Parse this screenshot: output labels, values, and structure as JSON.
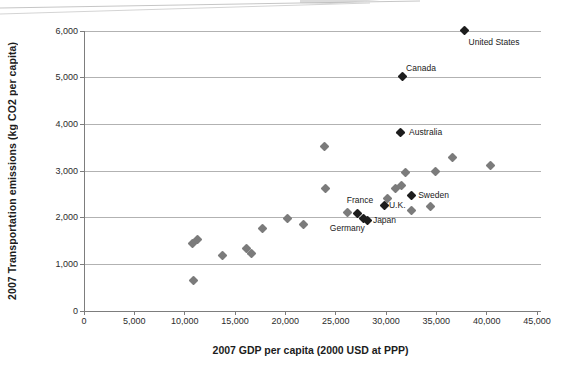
{
  "chart_data": {
    "type": "scatter",
    "title": "",
    "xlabel": "2007 GDP per capita (2000 USD at PPP)",
    "ylabel": "2007 Transportation emissions (kg CO2 per capita)",
    "xlim": [
      0,
      45000
    ],
    "ylim": [
      0,
      6000
    ],
    "x_ticks": [
      0,
      5000,
      10000,
      15000,
      20000,
      25000,
      30000,
      35000,
      40000,
      45000
    ],
    "x_tick_labels": [
      "0",
      "5,000",
      "10,000",
      "15,000",
      "20,000",
      "25,000",
      "30,000",
      "35,000",
      "40,000",
      "45,000"
    ],
    "y_ticks": [
      0,
      1000,
      2000,
      3000,
      4000,
      5000,
      6000
    ],
    "y_tick_labels": [
      "0",
      "1,000",
      "2,000",
      "3,000",
      "4,000",
      "5,000",
      "6,000"
    ],
    "grid": "horizontal",
    "legend": "none",
    "colors": {
      "labeled_marker": "#1d1d1d",
      "unlabeled_marker": "#7b7b7b",
      "gridline": "#b2b2b2",
      "axis": "#7d7d7d"
    },
    "series": [
      {
        "name": "unlabeled-countries",
        "marker": "diamond",
        "color": "#7b7b7b",
        "points": [
          {
            "x": 10900,
            "y": 650
          },
          {
            "x": 10800,
            "y": 1440
          },
          {
            "x": 11300,
            "y": 1530
          },
          {
            "x": 13800,
            "y": 1180
          },
          {
            "x": 16100,
            "y": 1330
          },
          {
            "x": 16600,
            "y": 1240
          },
          {
            "x": 17700,
            "y": 1760
          },
          {
            "x": 20200,
            "y": 1980
          },
          {
            "x": 21800,
            "y": 1860
          },
          {
            "x": 24000,
            "y": 2620
          },
          {
            "x": 23900,
            "y": 3530
          },
          {
            "x": 26200,
            "y": 2120
          },
          {
            "x": 30100,
            "y": 2420
          },
          {
            "x": 30900,
            "y": 2620
          },
          {
            "x": 31500,
            "y": 2700
          },
          {
            "x": 31900,
            "y": 2960
          },
          {
            "x": 32500,
            "y": 2160
          },
          {
            "x": 34400,
            "y": 2250
          },
          {
            "x": 34900,
            "y": 3000
          },
          {
            "x": 36600,
            "y": 3280
          },
          {
            "x": 40400,
            "y": 3120
          }
        ]
      },
      {
        "name": "labeled-countries",
        "marker": "diamond",
        "color": "#1d1d1d",
        "points": [
          {
            "label": "United States",
            "x": 37800,
            "y": 6010,
            "label_pos": "below-right"
          },
          {
            "label": "Canada",
            "x": 31600,
            "y": 5020,
            "label_pos": "above-right"
          },
          {
            "label": "Australia",
            "x": 31400,
            "y": 3830,
            "label_pos": "right",
            "label_dx": 9
          },
          {
            "label": "Sweden",
            "x": 32500,
            "y": 2480,
            "label_pos": "right",
            "label_dx": 7
          },
          {
            "label": "U.K.",
            "x": 29900,
            "y": 2260,
            "label_pos": "right",
            "label_dx": 4
          },
          {
            "label": "France",
            "x": 27200,
            "y": 2080,
            "label_pos": "above-left"
          },
          {
            "label": "Germany",
            "x": 27800,
            "y": 1975,
            "label_pos": "below-left"
          },
          {
            "label": "Japan",
            "x": 28200,
            "y": 1935,
            "label_pos": "right",
            "label_dx": 5
          }
        ]
      }
    ]
  }
}
